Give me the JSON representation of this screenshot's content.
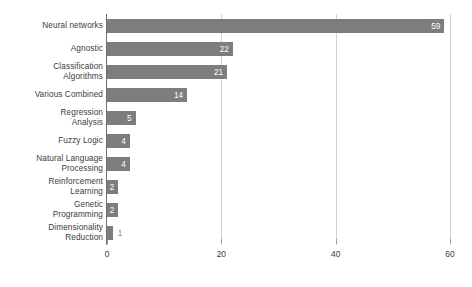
{
  "chart_data": {
    "type": "bar",
    "orientation": "horizontal",
    "title": "",
    "xlabel": "",
    "ylabel": "",
    "xlim": [
      0,
      60
    ],
    "xticks": [
      0,
      20,
      40,
      60
    ],
    "grid": "vertical",
    "legend": "none",
    "bar_color": "#7d7d7d",
    "inside_label_color": "#ffffff",
    "outside_label_color": "#8a8a8a",
    "categories": [
      "Neural networks",
      "Agnostic",
      "Classification\nAlgorithms",
      "Various Combined",
      "Regression\nAnalysis",
      "Fuzzy Logic",
      "Natural Language\nProcessing",
      "Reinforcement\nLearning",
      "Genetic\nProgramming",
      "Dimensionality\nReduction"
    ],
    "values": [
      59,
      22,
      21,
      14,
      5,
      4,
      4,
      2,
      2,
      1
    ],
    "labels": [
      "59",
      "22",
      "21",
      "14",
      "5",
      "4",
      "4",
      "2",
      "2",
      "1"
    ],
    "label_positions": [
      "inside",
      "inside",
      "inside",
      "inside",
      "inside",
      "inside",
      "inside",
      "inside",
      "inside",
      "outside"
    ]
  }
}
